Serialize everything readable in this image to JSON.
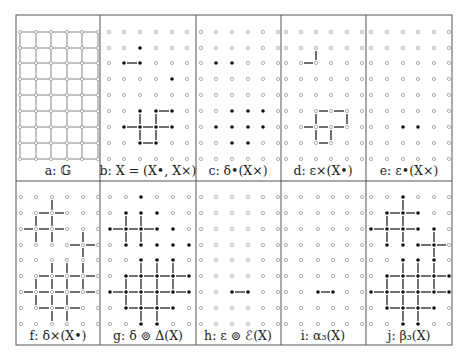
{
  "figure": {
    "frame": {
      "left": 16,
      "top": 15,
      "right": 452,
      "bottom": 345,
      "row_divider": 181
    },
    "column_dividers": [
      100,
      196,
      281,
      366
    ],
    "colors": {
      "frame": "#555555",
      "grid_edge": "#888888",
      "hollow_node": "#999999",
      "filled_node": "#111111",
      "edge": "#222222"
    },
    "row_y": {
      "top": [
        32,
        48,
        63,
        79,
        95,
        111,
        127,
        143,
        159
      ],
      "bottom": [
        197,
        213,
        229,
        245,
        260,
        276,
        292,
        308,
        324
      ]
    },
    "panels": [
      {
        "id": "a",
        "label": "a: 𝔾",
        "row": "top",
        "cols": [
          20,
          36,
          51,
          67,
          82,
          98
        ],
        "label_x": 58,
        "type": "full-grid",
        "filled": [],
        "hedges": [],
        "vedges": []
      },
      {
        "id": "b",
        "label": "b: X = (X•, X×)",
        "row": "top",
        "cols": [
          109,
          124,
          140,
          156,
          172,
          187
        ],
        "label_x": 148,
        "filled": [
          [
            1,
            2
          ],
          [
            2,
            1
          ],
          [
            2,
            2
          ],
          [
            3,
            4
          ],
          [
            5,
            2
          ],
          [
            5,
            3
          ],
          [
            5,
            4
          ],
          [
            6,
            1
          ],
          [
            6,
            2
          ],
          [
            6,
            3
          ],
          [
            6,
            4
          ],
          [
            7,
            2
          ],
          [
            7,
            3
          ]
        ],
        "hedges": [
          [
            2,
            1
          ],
          [
            5,
            3
          ],
          [
            6,
            1
          ],
          [
            6,
            2
          ],
          [
            6,
            3
          ],
          [
            7,
            2
          ]
        ],
        "vedges": [
          [
            5,
            2
          ],
          [
            5,
            3
          ],
          [
            6,
            2
          ],
          [
            6,
            3
          ]
        ]
      },
      {
        "id": "c",
        "label": "c: δ•(X×)",
        "row": "top",
        "cols": [
          201,
          216,
          232,
          248,
          263,
          278
        ],
        "label_x": 238,
        "filled": [
          [
            2,
            1
          ],
          [
            2,
            2
          ],
          [
            5,
            2
          ],
          [
            5,
            3
          ],
          [
            5,
            4
          ],
          [
            6,
            1
          ],
          [
            6,
            2
          ],
          [
            6,
            3
          ],
          [
            6,
            4
          ],
          [
            7,
            2
          ],
          [
            7,
            3
          ]
        ],
        "hedges": [],
        "vedges": []
      },
      {
        "id": "d",
        "label": "d: ε×(X•)",
        "row": "top",
        "cols": [
          286,
          301,
          316,
          331,
          347,
          362
        ],
        "label_x": 323,
        "filled": [],
        "hedges": [
          [
            2,
            1
          ],
          [
            5,
            2
          ],
          [
            5,
            3
          ],
          [
            6,
            1
          ],
          [
            6,
            2
          ],
          [
            6,
            3
          ],
          [
            7,
            2
          ]
        ],
        "vedges": [
          [
            1,
            2
          ],
          [
            5,
            2
          ],
          [
            5,
            4
          ],
          [
            6,
            2
          ],
          [
            6,
            3
          ]
        ]
      },
      {
        "id": "e",
        "label": "e: ε•(X×)",
        "row": "top",
        "cols": [
          371,
          387,
          403,
          418,
          434,
          449
        ],
        "label_x": 409,
        "filled": [
          [
            6,
            2
          ],
          [
            6,
            3
          ]
        ],
        "hedges": [],
        "vedges": []
      },
      {
        "id": "f",
        "label": "f: δ×(X•)",
        "row": "bottom",
        "cols": [
          21,
          36,
          52,
          67,
          83,
          98
        ],
        "label_x": 58,
        "filled": [],
        "hedges": [
          [
            1,
            1
          ],
          [
            1,
            2
          ],
          [
            2,
            0
          ],
          [
            2,
            1
          ],
          [
            2,
            2
          ],
          [
            3,
            3
          ],
          [
            3,
            4
          ],
          [
            5,
            1
          ],
          [
            5,
            2
          ],
          [
            5,
            3
          ],
          [
            5,
            4
          ],
          [
            6,
            0
          ],
          [
            6,
            1
          ],
          [
            6,
            2
          ],
          [
            6,
            3
          ],
          [
            6,
            4
          ],
          [
            7,
            1
          ],
          [
            7,
            2
          ],
          [
            7,
            3
          ]
        ],
        "vedges": [
          [
            0,
            2
          ],
          [
            1,
            1
          ],
          [
            1,
            2
          ],
          [
            2,
            1
          ],
          [
            2,
            2
          ],
          [
            2,
            4
          ],
          [
            3,
            4
          ],
          [
            4,
            2
          ],
          [
            4,
            3
          ],
          [
            4,
            4
          ],
          [
            5,
            1
          ],
          [
            5,
            2
          ],
          [
            5,
            3
          ],
          [
            5,
            4
          ],
          [
            6,
            1
          ],
          [
            6,
            2
          ],
          [
            6,
            3
          ],
          [
            7,
            2
          ],
          [
            7,
            3
          ]
        ]
      },
      {
        "id": "g",
        "label": "g: δ ⊚ Δ(X)",
        "row": "bottom",
        "cols": [
          110,
          126,
          141,
          157,
          173,
          189
        ],
        "label_x": 148,
        "filled": [
          [
            0,
            2
          ],
          [
            1,
            1
          ],
          [
            1,
            2
          ],
          [
            1,
            3
          ],
          [
            2,
            0
          ],
          [
            2,
            1
          ],
          [
            2,
            2
          ],
          [
            2,
            3
          ],
          [
            2,
            4
          ],
          [
            3,
            1
          ],
          [
            3,
            2
          ],
          [
            3,
            3
          ],
          [
            3,
            4
          ],
          [
            3,
            5
          ],
          [
            4,
            2
          ],
          [
            4,
            3
          ],
          [
            4,
            4
          ],
          [
            5,
            1
          ],
          [
            5,
            2
          ],
          [
            5,
            3
          ],
          [
            5,
            4
          ],
          [
            5,
            5
          ],
          [
            6,
            0
          ],
          [
            6,
            1
          ],
          [
            6,
            2
          ],
          [
            6,
            3
          ],
          [
            6,
            4
          ],
          [
            6,
            5
          ],
          [
            7,
            1
          ],
          [
            7,
            2
          ],
          [
            7,
            3
          ],
          [
            7,
            4
          ],
          [
            8,
            2
          ],
          [
            8,
            3
          ]
        ],
        "hedges": [
          [
            2,
            0
          ],
          [
            2,
            1
          ],
          [
            2,
            2
          ],
          [
            5,
            1
          ],
          [
            5,
            2
          ],
          [
            5,
            3
          ],
          [
            5,
            4
          ],
          [
            6,
            0
          ],
          [
            6,
            1
          ],
          [
            6,
            2
          ],
          [
            6,
            3
          ],
          [
            6,
            4
          ],
          [
            7,
            1
          ],
          [
            7,
            2
          ],
          [
            7,
            3
          ]
        ],
        "vedges": [
          [
            1,
            1
          ],
          [
            1,
            2
          ],
          [
            2,
            1
          ],
          [
            2,
            2
          ],
          [
            4,
            2
          ],
          [
            4,
            3
          ],
          [
            4,
            4
          ],
          [
            5,
            1
          ],
          [
            5,
            2
          ],
          [
            5,
            3
          ],
          [
            5,
            4
          ],
          [
            6,
            1
          ],
          [
            6,
            2
          ],
          [
            6,
            3
          ],
          [
            7,
            2
          ],
          [
            7,
            3
          ]
        ]
      },
      {
        "id": "h",
        "label": "h: ε ⊚ ℰ(X)",
        "row": "bottom",
        "cols": [
          201,
          216,
          232,
          248,
          263,
          278
        ],
        "label_x": 238,
        "filled": [
          [
            6,
            2
          ],
          [
            6,
            3
          ]
        ],
        "hedges": [
          [
            6,
            2
          ]
        ],
        "vedges": []
      },
      {
        "id": "i",
        "label": "i: α₃(X)",
        "row": "bottom",
        "cols": [
          286,
          301,
          318,
          333,
          347,
          362
        ],
        "label_x": 323,
        "filled": [
          [
            6,
            2
          ],
          [
            6,
            3
          ]
        ],
        "hedges": [
          [
            6,
            2
          ]
        ],
        "vedges": []
      },
      {
        "id": "j",
        "label": "j: β₃(X)",
        "row": "bottom",
        "cols": [
          371,
          387,
          403,
          418,
          434,
          449
        ],
        "label_x": 409,
        "filled": [
          [
            0,
            2
          ],
          [
            1,
            1
          ],
          [
            1,
            2
          ],
          [
            1,
            3
          ],
          [
            2,
            0
          ],
          [
            2,
            1
          ],
          [
            2,
            2
          ],
          [
            2,
            3
          ],
          [
            2,
            4
          ],
          [
            3,
            1
          ],
          [
            3,
            2
          ],
          [
            3,
            3
          ],
          [
            3,
            4
          ],
          [
            4,
            2
          ],
          [
            4,
            3
          ],
          [
            4,
            4
          ],
          [
            5,
            1
          ],
          [
            5,
            2
          ],
          [
            5,
            3
          ],
          [
            5,
            4
          ],
          [
            5,
            5
          ],
          [
            6,
            0
          ],
          [
            6,
            1
          ],
          [
            6,
            2
          ],
          [
            6,
            3
          ],
          [
            6,
            4
          ],
          [
            6,
            5
          ],
          [
            7,
            1
          ],
          [
            7,
            2
          ],
          [
            7,
            3
          ],
          [
            7,
            4
          ],
          [
            8,
            2
          ],
          [
            8,
            3
          ]
        ],
        "hedges": [
          [
            1,
            1
          ],
          [
            1,
            2
          ],
          [
            2,
            0
          ],
          [
            2,
            1
          ],
          [
            2,
            2
          ],
          [
            3,
            3
          ],
          [
            3,
            4
          ],
          [
            5,
            1
          ],
          [
            5,
            2
          ],
          [
            5,
            3
          ],
          [
            5,
            4
          ],
          [
            6,
            0
          ],
          [
            6,
            1
          ],
          [
            6,
            2
          ],
          [
            6,
            3
          ],
          [
            6,
            4
          ],
          [
            7,
            1
          ],
          [
            7,
            2
          ],
          [
            7,
            3
          ]
        ],
        "vedges": [
          [
            0,
            2
          ],
          [
            1,
            1
          ],
          [
            1,
            2
          ],
          [
            2,
            1
          ],
          [
            2,
            2
          ],
          [
            2,
            4
          ],
          [
            3,
            4
          ],
          [
            4,
            2
          ],
          [
            4,
            3
          ],
          [
            4,
            4
          ],
          [
            5,
            1
          ],
          [
            5,
            2
          ],
          [
            5,
            3
          ],
          [
            5,
            4
          ],
          [
            6,
            1
          ],
          [
            6,
            2
          ],
          [
            6,
            3
          ],
          [
            7,
            2
          ],
          [
            7,
            3
          ]
        ]
      }
    ],
    "label_y": {
      "top": 172,
      "bottom": 337
    }
  }
}
